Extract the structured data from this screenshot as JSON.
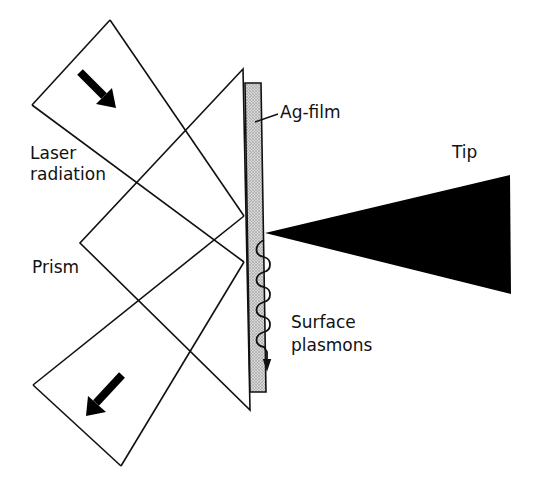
{
  "labels": {
    "laser_line1": "Laser",
    "laser_line2": "radiation",
    "prism": "Prism",
    "ag_film": "Ag-film",
    "tip": "Tip",
    "plasmons_line1": "Surface",
    "plasmons_line2": "plasmons"
  },
  "colors": {
    "line": "#111111",
    "film_fill": "#c8c8c8",
    "tip_fill": "#000000",
    "background": "#ffffff"
  },
  "elements": {
    "incoming_beam": "laser-beam-in",
    "outgoing_beam": "laser-beam-out",
    "prism": "prism",
    "film": "ag-film",
    "tip": "tip",
    "plasmon_wave": "surface-plasmon-wave"
  }
}
